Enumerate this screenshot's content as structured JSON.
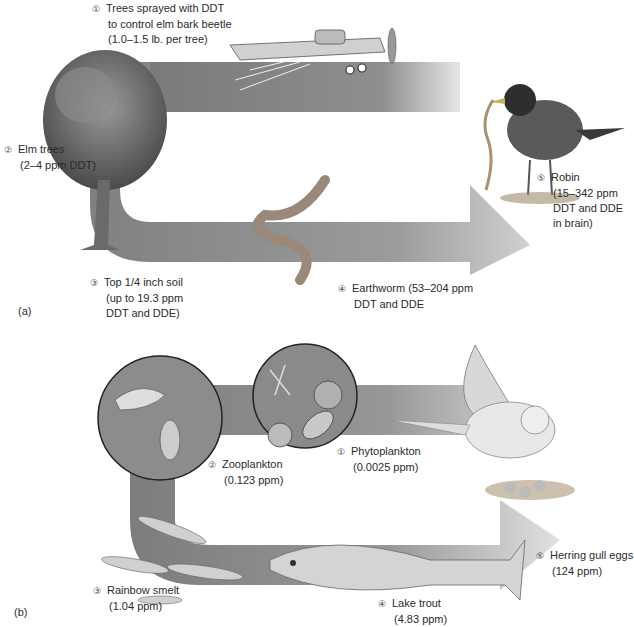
{
  "panel_a": {
    "label": "(a)",
    "steps": [
      {
        "num": "①",
        "lines": [
          "Trees sprayed with DDT",
          "to control elm bark beetle",
          "(1.0–1.5 lb. per tree)"
        ]
      },
      {
        "num": "②",
        "lines": [
          "Elm trees",
          "(2–4 ppm DDT)"
        ]
      },
      {
        "num": "③",
        "lines": [
          "Top 1/4 inch soil",
          "(up to 19.3 ppm",
          "DDT and DDE)"
        ]
      },
      {
        "num": "④",
        "lines": [
          "Earthworm (53–204 ppm",
          "DDT and DDE"
        ]
      },
      {
        "num": "⑤",
        "lines": [
          "Robin",
          "(15–342 ppm",
          "DDT and DDE",
          "in brain)"
        ]
      }
    ]
  },
  "panel_b": {
    "label": "(b)",
    "steps": [
      {
        "num": "①",
        "lines": [
          "Phytoplankton",
          "(0.0025 ppm)"
        ]
      },
      {
        "num": "②",
        "lines": [
          "Zooplankton",
          "(0.123 ppm)"
        ]
      },
      {
        "num": "③",
        "lines": [
          "Rainbow smelt",
          "(1.04 ppm)"
        ]
      },
      {
        "num": "④",
        "lines": [
          "Lake trout",
          "(4.83 ppm)"
        ]
      },
      {
        "num": "⑤",
        "lines": [
          "Herring gull eggs",
          "(124 ppm)"
        ]
      }
    ]
  },
  "colors": {
    "arrow_dark": "#6e6e6e",
    "arrow_light": "#d8d8d8",
    "text": "#2b2b2b"
  }
}
